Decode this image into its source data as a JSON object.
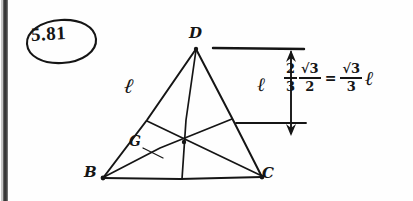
{
  "page": {
    "background_color": "#fefefe",
    "ink_color": "#151515",
    "scan_artifact": "left-edge-dark-band"
  },
  "problem": {
    "number": "5.81"
  },
  "figure": {
    "type": "triangle-with-medians",
    "vertices": [
      {
        "name": "D",
        "label": "D",
        "position": "apex-top"
      },
      {
        "name": "B",
        "label": "B",
        "position": "bottom-left"
      },
      {
        "name": "C",
        "label": "C",
        "position": "bottom-right"
      }
    ],
    "centroid": {
      "name": "G",
      "label": "G"
    },
    "side_label": "ℓ"
  },
  "dimension": {
    "label": "ℓ",
    "arrow": "double-headed-vertical"
  },
  "equation": {
    "leading_symbol": "ℓ",
    "fraction1": {
      "numerator": "2",
      "denominator": "3"
    },
    "fraction2": {
      "numerator": "√3",
      "denominator": "2"
    },
    "equals": "=",
    "result_fraction": {
      "numerator": "√3",
      "denominator": "3"
    },
    "result_symbol": "ℓ",
    "plain_text": "ℓ · 2/3 · √3/2 = √3/3 ℓ"
  }
}
